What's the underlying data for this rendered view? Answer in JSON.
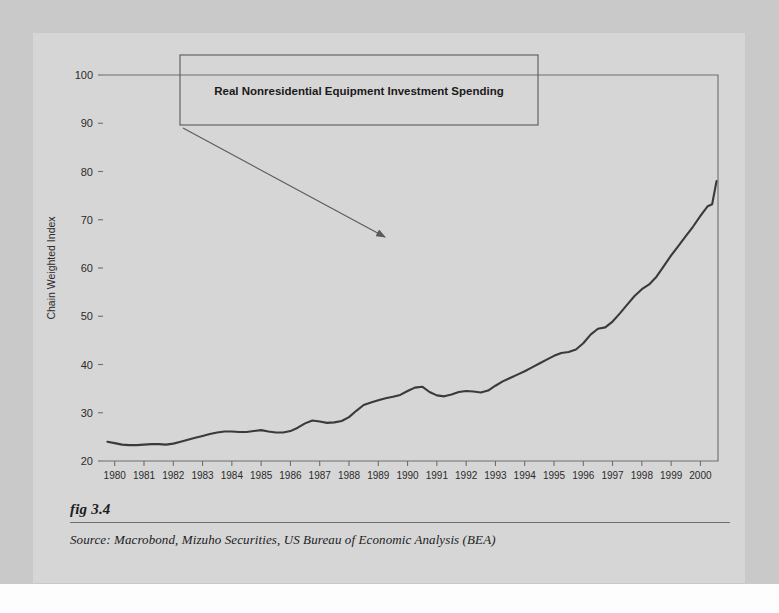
{
  "figure": {
    "caption": "fig 3.4",
    "source": "Source:  Macrobond, Mizuho Securities, US Bureau of Economic Analysis (BEA)"
  },
  "colors": {
    "page_band": "#c9c9c9",
    "figure_panel": "#d6d6d6",
    "series_line": "#3a3a3a",
    "axis": "#6e6e6e",
    "text": "#1c1c1c",
    "annotation_border": "#5a5a5a"
  },
  "chart_data": {
    "type": "line",
    "title": "",
    "xlabel": "",
    "ylabel": "Chain Weighted Index",
    "xlim": [
      1979.6,
      2000.6
    ],
    "ylim": [
      20,
      100
    ],
    "yticks": [
      20,
      30,
      40,
      50,
      60,
      70,
      80,
      90,
      100
    ],
    "xticks": [
      1980,
      1981,
      1982,
      1983,
      1984,
      1985,
      1986,
      1987,
      1988,
      1989,
      1990,
      1991,
      1992,
      1993,
      1994,
      1995,
      1996,
      1997,
      1998,
      1999,
      2000
    ],
    "xtick_labels": [
      "1980",
      "1981",
      "1982",
      "1983",
      "1984",
      "1985",
      "1986",
      "1987",
      "1988",
      "1989",
      "1990",
      "1991",
      "1992",
      "1993",
      "1994",
      "1995",
      "1996",
      "1997",
      "1998",
      "1999",
      "2000"
    ],
    "grid": false,
    "legend": false,
    "annotations": [
      {
        "text": "Real Nonresidential Equipment Investment Spending",
        "type": "boxed-label-with-arrow",
        "arrow_from": [
          1984.6,
          95.4
        ],
        "arrow_to": [
          1990.9,
          59.8
        ]
      }
    ],
    "series": [
      {
        "name": "Real Nonresidential Equipment Investment Spending",
        "x": [
          1979.75,
          1980.0,
          1980.25,
          1980.5,
          1980.75,
          1981.0,
          1981.25,
          1981.5,
          1981.75,
          1982.0,
          1982.25,
          1982.5,
          1982.75,
          1983.0,
          1983.25,
          1983.5,
          1983.75,
          1984.0,
          1984.25,
          1984.5,
          1984.75,
          1985.0,
          1985.25,
          1985.5,
          1985.75,
          1986.0,
          1986.25,
          1986.5,
          1986.75,
          1987.0,
          1987.25,
          1987.5,
          1987.75,
          1988.0,
          1988.25,
          1988.5,
          1988.75,
          1989.0,
          1989.25,
          1989.5,
          1989.75,
          1990.0,
          1990.25,
          1990.5,
          1990.75,
          1991.0,
          1991.25,
          1991.5,
          1991.75,
          1992.0,
          1992.25,
          1992.5,
          1992.75,
          1993.0,
          1993.25,
          1993.5,
          1993.75,
          1994.0,
          1994.25,
          1994.5,
          1994.75,
          1995.0,
          1995.25,
          1995.5,
          1995.75,
          1996.0,
          1996.25,
          1996.5,
          1996.75,
          1997.0,
          1997.25,
          1997.5,
          1997.75,
          1998.0,
          1998.25,
          1998.5,
          1998.75,
          1999.0,
          1999.25,
          1999.5,
          1999.75,
          2000.0,
          2000.25
        ],
        "y": [
          24.0,
          23.7,
          23.4,
          23.3,
          23.3,
          23.4,
          23.5,
          23.5,
          23.4,
          23.6,
          24.0,
          24.4,
          24.8,
          25.2,
          25.6,
          25.9,
          26.1,
          26.1,
          26.0,
          26.0,
          26.2,
          26.4,
          26.1,
          25.9,
          25.9,
          26.2,
          26.9,
          27.8,
          28.4,
          28.2,
          27.9,
          28.0,
          28.3,
          29.1,
          30.4,
          31.6,
          32.1,
          32.6,
          33.0,
          33.3,
          33.7,
          34.5,
          35.2,
          35.4,
          34.3,
          33.6,
          33.4,
          33.8,
          34.3,
          34.5,
          34.4,
          34.2,
          34.6,
          35.6,
          36.5,
          37.2,
          37.9,
          38.6,
          39.4,
          40.2,
          41.0,
          41.8,
          42.4,
          42.6,
          43.1,
          44.4,
          46.2,
          47.4,
          47.7,
          48.9,
          50.6,
          52.4,
          54.2,
          55.6,
          56.6,
          58.2,
          60.4,
          62.6,
          64.6,
          66.6,
          68.6,
          70.8,
          72.8
        ],
        "values_note": "Chain weighted index, quarterly"
      }
    ],
    "series_extended": {
      "tail_x": [
        2000.4,
        2000.55
      ],
      "tail_y": [
        73.2,
        78.0
      ]
    }
  },
  "axis": {
    "y_title": "Chain Weighted Index"
  }
}
